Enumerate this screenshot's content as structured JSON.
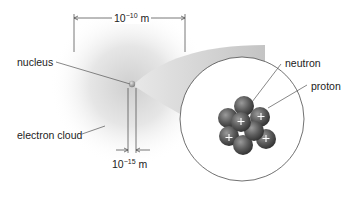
{
  "diagram": {
    "labels": {
      "nucleus": "nucleus",
      "electron_cloud": "electron cloud",
      "neutron": "neutron",
      "proton": "proton"
    },
    "dimensions": {
      "atom_size": {
        "base": "10",
        "exponent": "−10",
        "unit": "m"
      },
      "nucleus_size": {
        "base": "10",
        "exponent": "−15",
        "unit": "m"
      }
    },
    "nucleus_particles": {
      "protons_marked": 5,
      "symbol": "+"
    },
    "colors": {
      "cloud": "#d9d9d9",
      "particle": "#5a5a5a",
      "line": "#555555"
    }
  }
}
